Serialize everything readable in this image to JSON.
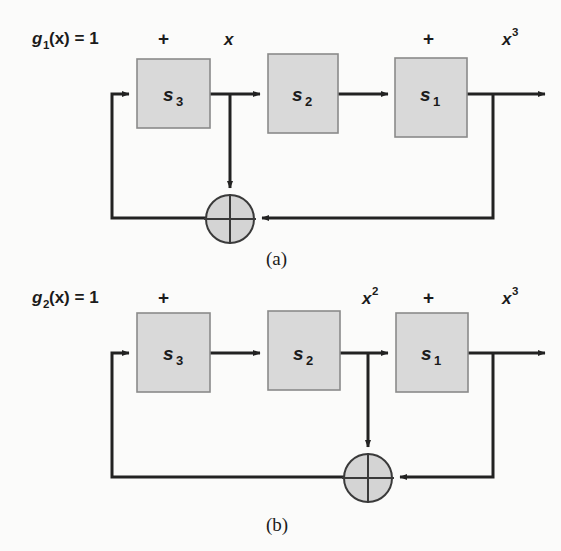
{
  "figure": {
    "background_color": "#fbfbfa",
    "line_color": "#222222",
    "block_fill": "#d9d9d9",
    "block_stroke": "#8a8a8a",
    "sum_fill": "#d4d4d4"
  },
  "panels": [
    {
      "id": "panel-a",
      "caption": "(a)",
      "input_label": {
        "base": "g",
        "sub": "1",
        "rest": "(x) = 1"
      },
      "signal_labels": [
        {
          "name": "plus-left",
          "text": "+"
        },
        {
          "name": "x-label",
          "base": "x",
          "sup": ""
        },
        {
          "name": "plus-right",
          "text": "+"
        },
        {
          "name": "x-cubed-label",
          "base": "x",
          "sup": "3"
        }
      ],
      "blocks": [
        {
          "name": "block-s3",
          "base": "s",
          "sub": "3"
        },
        {
          "name": "block-s2",
          "base": "s",
          "sub": "2"
        },
        {
          "name": "block-s1",
          "base": "s",
          "sub": "1"
        }
      ],
      "summing_junction": {
        "name": "summing-junction",
        "symbol": "+"
      },
      "feedback_tap": "after-s3",
      "output_tap": "after-s1"
    },
    {
      "id": "panel-b",
      "caption": "(b)",
      "input_label": {
        "base": "g",
        "sub": "2",
        "rest": "(x) = 1"
      },
      "signal_labels": [
        {
          "name": "plus-left",
          "text": "+"
        },
        {
          "name": "x-squared-label",
          "base": "x",
          "sup": "2"
        },
        {
          "name": "plus-right",
          "text": "+"
        },
        {
          "name": "x-cubed-label",
          "base": "x",
          "sup": "3"
        }
      ],
      "blocks": [
        {
          "name": "block-s3",
          "base": "s",
          "sub": "3"
        },
        {
          "name": "block-s2",
          "base": "s",
          "sub": "2"
        },
        {
          "name": "block-s1",
          "base": "s",
          "sub": "1"
        }
      ],
      "summing_junction": {
        "name": "summing-junction",
        "symbol": "+"
      },
      "feedback_tap": "after-s2",
      "output_tap": "after-s1"
    }
  ]
}
